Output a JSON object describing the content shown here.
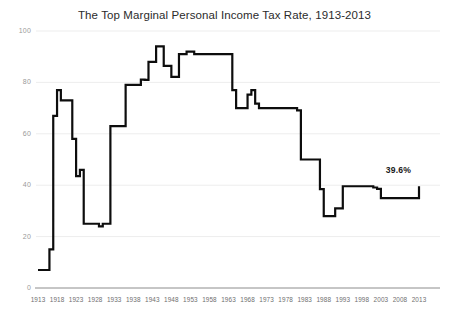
{
  "chart_data": {
    "type": "line",
    "title": "The Top Marginal Personal Income Tax Rate, 1913-2013",
    "xlabel": "",
    "ylabel": "",
    "xlim": [
      1913,
      2013
    ],
    "ylim": [
      0,
      100
    ],
    "grid": true,
    "grid_axis": "y",
    "legend": "none",
    "line_color": "#0d0d0d",
    "line_width": 2.2,
    "gridline_color": "#ededed",
    "axis_color": "#8c8c8c",
    "background_color": "#ffffff",
    "y_ticks": [
      0,
      20,
      40,
      60,
      80,
      100
    ],
    "x_ticks": [
      1913,
      1918,
      1923,
      1928,
      1933,
      1938,
      1943,
      1948,
      1953,
      1958,
      1963,
      1968,
      1973,
      1978,
      1983,
      1988,
      1993,
      1998,
      2003,
      2008,
      2013
    ],
    "annotations": [
      {
        "text": "39.6%",
        "x": 2009,
        "y": 45.5,
        "bold": true
      }
    ],
    "series": [
      {
        "name": "Top marginal personal income tax rate",
        "x": [
          1913,
          1914,
          1915,
          1916,
          1917,
          1918,
          1919,
          1920,
          1921,
          1922,
          1923,
          1924,
          1925,
          1926,
          1927,
          1928,
          1929,
          1930,
          1931,
          1932,
          1933,
          1934,
          1935,
          1936,
          1937,
          1938,
          1939,
          1940,
          1941,
          1942,
          1943,
          1944,
          1945,
          1946,
          1947,
          1948,
          1949,
          1950,
          1951,
          1952,
          1953,
          1954,
          1955,
          1956,
          1957,
          1958,
          1959,
          1960,
          1961,
          1962,
          1963,
          1964,
          1965,
          1966,
          1967,
          1968,
          1969,
          1970,
          1971,
          1972,
          1973,
          1974,
          1975,
          1976,
          1977,
          1978,
          1979,
          1980,
          1981,
          1982,
          1983,
          1984,
          1985,
          1986,
          1987,
          1988,
          1989,
          1990,
          1991,
          1992,
          1993,
          1994,
          1995,
          1996,
          1997,
          1998,
          1999,
          2000,
          2001,
          2002,
          2003,
          2004,
          2005,
          2006,
          2007,
          2008,
          2009,
          2010,
          2011,
          2012,
          2013
        ],
        "y": [
          7,
          7,
          7,
          15,
          67,
          77,
          73,
          73,
          73,
          58,
          43.5,
          46,
          25,
          25,
          25,
          25,
          24,
          25,
          25,
          63,
          63,
          63,
          63,
          79,
          79,
          79,
          79,
          81.1,
          81,
          88,
          88,
          94,
          94,
          86.45,
          86.45,
          82.13,
          82.13,
          91,
          91,
          92,
          92,
          91,
          91,
          91,
          91,
          91,
          91,
          91,
          91,
          91,
          91,
          77,
          70,
          70,
          70,
          75.25,
          77,
          71.75,
          70,
          70,
          70,
          70,
          70,
          70,
          70,
          70,
          70,
          70,
          69.125,
          50,
          50,
          50,
          50,
          50,
          38.5,
          28,
          28,
          28,
          31,
          31,
          39.6,
          39.6,
          39.6,
          39.6,
          39.6,
          39.6,
          39.6,
          39.6,
          39.1,
          38.6,
          35,
          35,
          35,
          35,
          35,
          35,
          35,
          35,
          35,
          35,
          39.6
        ]
      }
    ]
  }
}
